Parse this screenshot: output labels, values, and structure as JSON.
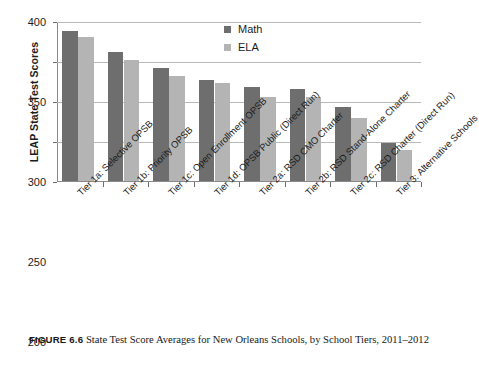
{
  "figure": {
    "caption_label": "FIGURE 6.6",
    "caption_text": "State Test Score Averages for New Orleans Schools, by School Tiers, 2011–2012"
  },
  "chart_data": {
    "type": "bar",
    "title": "",
    "xlabel": "",
    "ylabel": "LEAP State Test Scores",
    "ylim": [
      200,
      400
    ],
    "yticks": [
      200,
      250,
      300,
      350,
      400
    ],
    "grid": true,
    "legend_position": "top-right",
    "categories": [
      "Tier 1a: Selective OPSB",
      "Tier 1b: Priority OPSB",
      "Tier 1c: Open Enrollment OPSB",
      "Tier 1d: OPSB Public (Direct Run)",
      "Tier 2a: RSD CMO Charter",
      "Tier 2b: RSD Stand-Alone Charter",
      "Tier 2c: RSD Charter (Direct Run)",
      "Tier 3: Alternative Schools"
    ],
    "series": [
      {
        "name": "Math",
        "color": "#6e6e6e",
        "values": [
          389,
          362,
          343,
          327,
          319,
          316,
          294,
          249
        ]
      },
      {
        "name": "ELA",
        "color": "#b4b4b4",
        "values": [
          381,
          352,
          332,
          324,
          306,
          306,
          280,
          240
        ]
      }
    ]
  }
}
